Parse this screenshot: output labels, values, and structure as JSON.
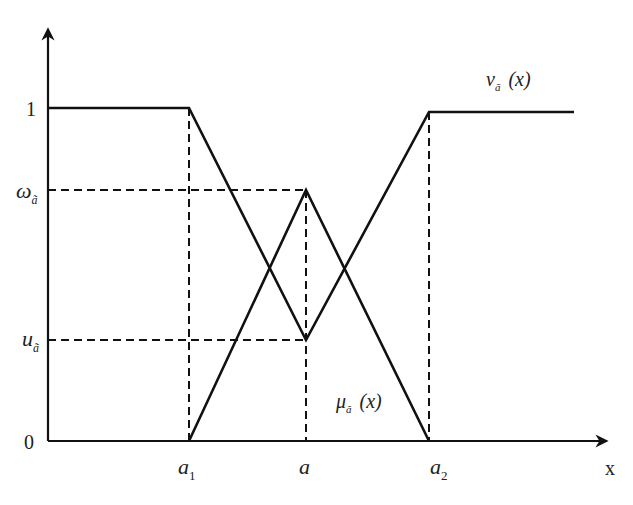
{
  "diagram": {
    "type": "intuitionistic triangular fuzzy number membership/non-membership diagram",
    "axes": {
      "x_label": "x",
      "y_ticks": [
        "1",
        "0"
      ]
    },
    "y_levels": {
      "omega": {
        "symbol": "ω",
        "subscript": "ã"
      },
      "u": {
        "symbol": "u",
        "subscript": "ã"
      }
    },
    "x_ticks": [
      {
        "symbol": "a",
        "subscript": "1"
      },
      {
        "symbol": "a",
        "subscript": ""
      },
      {
        "symbol": "a",
        "subscript": "2"
      }
    ],
    "curves": {
      "membership": {
        "symbol": "μ",
        "subscript": "ã",
        "arg": "(x)"
      },
      "non_membership": {
        "symbol": "ν",
        "subscript": "ã",
        "arg": "(x)"
      }
    },
    "colors": {
      "line": "#111111",
      "text": "#222222",
      "background": "#ffffff"
    }
  }
}
